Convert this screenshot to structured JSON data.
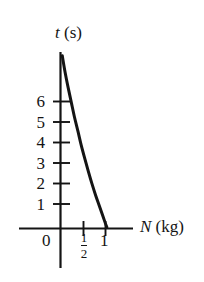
{
  "figure": {
    "background_color": "#ffffff",
    "ink_color": "#141414"
  },
  "axes": {
    "y_axis": {
      "label_variable": "t",
      "label_unit": "(s)",
      "label_full": "t (s)",
      "tick_labels": [
        "6",
        "5",
        "4",
        "3",
        "2",
        "1"
      ],
      "tick_values": [
        6,
        5,
        4,
        3,
        2,
        1
      ]
    },
    "x_axis": {
      "label_variable": "N",
      "label_unit": "(kg)",
      "label_full": "N (kg)",
      "origin_label": "0",
      "tick_labels": [
        "1/2",
        "1"
      ],
      "half_numerator": "1",
      "half_denominator": "2",
      "one_label": "1"
    }
  },
  "chart_data": {
    "type": "line",
    "title": "",
    "xlabel": "N (kg)",
    "ylabel": "t (s)",
    "xlim": [
      0,
      1.35
    ],
    "ylim": [
      0,
      7.6
    ],
    "grid": false,
    "legend": null,
    "xticks": [
      0,
      0.5,
      1
    ],
    "xticklabels": [
      "0",
      "1/2",
      "1"
    ],
    "yticks": [
      1,
      2,
      3,
      4,
      5,
      6
    ],
    "yticklabels": [
      "1",
      "2",
      "3",
      "4",
      "5",
      "6"
    ],
    "series": [
      {
        "name": "t vs N",
        "x": [
          0.04,
          0.1,
          0.17,
          0.24,
          0.31,
          0.39,
          0.46,
          0.54,
          0.62,
          0.7,
          0.78,
          0.86,
          0.93,
          0.99,
          1.03
        ],
        "y": [
          7.05,
          6.4,
          5.75,
          5.15,
          4.55,
          3.95,
          3.4,
          2.85,
          2.32,
          1.82,
          1.36,
          0.94,
          0.57,
          0.25,
          0.05
        ]
      }
    ]
  }
}
